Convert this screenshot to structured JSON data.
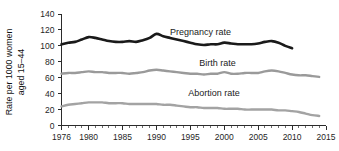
{
  "chart_data": {
    "type": "line",
    "title": "",
    "subtitle": "",
    "xlabel": "",
    "ylabel": "Rate per 1000 women aged 15–44",
    "ylabel_line1": "Rate per 1000 women",
    "ylabel_line2": "aged 15–44",
    "xlim": [
      1976,
      2015
    ],
    "ylim": [
      0,
      140
    ],
    "grid": false,
    "legend_position": "inline-annotations",
    "y_ticks": [
      0,
      20,
      40,
      60,
      80,
      100,
      120,
      140
    ],
    "y_tick_labels": [
      "0",
      "20",
      "40",
      "60",
      "80",
      "100",
      "120",
      "140"
    ],
    "x_ticks": [
      1976,
      1980,
      1985,
      1990,
      1995,
      2000,
      2005,
      2010,
      2015
    ],
    "x_tick_labels": [
      "1976",
      "1980",
      "1985",
      "1990",
      "1995",
      "2000",
      "2005",
      "2010",
      "2015"
    ],
    "x_minor_tick_interval": 1,
    "colors": {
      "pregnancy": "#1a1a1a",
      "birth": "#9a9a9a",
      "abortion": "#a3a3a3",
      "axis": "#2b2b2b",
      "background": "#ffffff",
      "text": "#1b1b1b"
    },
    "annotations": [
      {
        "text": "Pregnancy rate",
        "x": 1996.5,
        "y": 118
      },
      {
        "text": "Birth rate",
        "x": 1999.0,
        "y": 78
      },
      {
        "text": "Abortion rate",
        "x": 1998.5,
        "y": 41
      }
    ],
    "series": [
      {
        "name": "Pregnancy rate",
        "label": "Pregnancy rate",
        "color": "#1a1a1a",
        "stroke_width": 2.6,
        "x": [
          1976,
          1977,
          1978,
          1979,
          1980,
          1981,
          1982,
          1983,
          1984,
          1985,
          1986,
          1987,
          1988,
          1989,
          1990,
          1991,
          1992,
          1993,
          1994,
          1995,
          1996,
          1997,
          1998,
          1999,
          2000,
          2001,
          2002,
          2003,
          2004,
          2005,
          2006,
          2007,
          2008,
          2009,
          2010
        ],
        "values": [
          102,
          104,
          105,
          108,
          111,
          110,
          108,
          106,
          105,
          105,
          106,
          105,
          107,
          110,
          115,
          112,
          110,
          108,
          106,
          104,
          102,
          101,
          102,
          102,
          104,
          103,
          102,
          102,
          102,
          103,
          105,
          106,
          104,
          100,
          97
        ]
      },
      {
        "name": "Birth rate",
        "label": "Birth rate",
        "color": "#9a9a9a",
        "stroke_width": 2.4,
        "x": [
          1976,
          1977,
          1978,
          1979,
          1980,
          1981,
          1982,
          1983,
          1984,
          1985,
          1986,
          1987,
          1988,
          1989,
          1990,
          1991,
          1992,
          1993,
          1994,
          1995,
          1996,
          1997,
          1998,
          1999,
          2000,
          2001,
          2002,
          2003,
          2004,
          2005,
          2006,
          2007,
          2008,
          2009,
          2010,
          2011,
          2012,
          2013,
          2014
        ],
        "values": [
          65,
          66,
          66,
          67,
          68,
          67,
          67,
          66,
          66,
          66,
          65,
          66,
          67,
          69,
          70,
          69,
          68,
          67,
          66,
          65,
          65,
          64,
          65,
          65,
          67,
          65,
          65,
          66,
          66,
          66,
          68,
          69,
          68,
          66,
          64,
          63,
          63,
          62,
          61
        ]
      },
      {
        "name": "Abortion rate",
        "label": "Abortion rate",
        "color": "#a3a3a3",
        "stroke_width": 2.4,
        "x": [
          1976,
          1977,
          1978,
          1979,
          1980,
          1981,
          1982,
          1983,
          1984,
          1985,
          1986,
          1987,
          1988,
          1989,
          1990,
          1991,
          1992,
          1993,
          1994,
          1995,
          1996,
          1997,
          1998,
          1999,
          2000,
          2001,
          2002,
          2003,
          2004,
          2005,
          2006,
          2007,
          2008,
          2009,
          2010,
          2011,
          2012,
          2013,
          2014
        ],
        "values": [
          24,
          26,
          27,
          28,
          29,
          29,
          29,
          28,
          28,
          28,
          27,
          27,
          27,
          27,
          27,
          26,
          26,
          25,
          24,
          23,
          23,
          22,
          22,
          22,
          21,
          21,
          21,
          20,
          20,
          20,
          20,
          20,
          19,
          19,
          18,
          17,
          15,
          13,
          12
        ]
      }
    ]
  }
}
